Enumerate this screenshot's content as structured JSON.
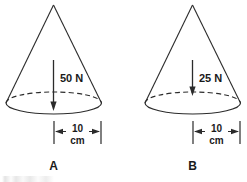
{
  "figure": {
    "background_color": "#ffffff",
    "ink_color": "#2b2b2b",
    "panels": [
      {
        "id": "A",
        "label": "A",
        "force": {
          "value": "50",
          "unit": "N",
          "text": "50 N",
          "direction": "down"
        },
        "dimension": {
          "value": "10",
          "unit": "cm",
          "measures": "base radius"
        }
      },
      {
        "id": "B",
        "label": "B",
        "force": {
          "value": "25",
          "unit": "N",
          "text": "25 N",
          "direction": "down"
        },
        "dimension": {
          "value": "10",
          "unit": "cm",
          "measures": "base radius"
        }
      }
    ]
  }
}
